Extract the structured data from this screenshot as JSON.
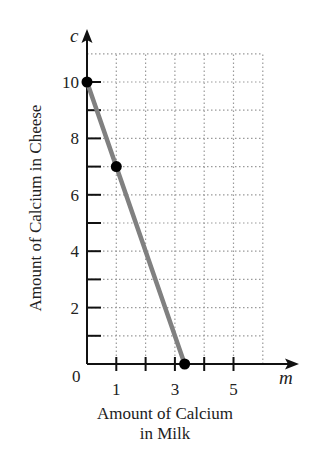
{
  "chart_data": {
    "type": "line",
    "title": "",
    "xlabel": "Amount of Calcium in Milk",
    "xlabel_lines": [
      "Amount of Calcium",
      "in Milk"
    ],
    "ylabel": "Amount of Calcium in Cheese",
    "x_var": "m",
    "y_var": "c",
    "xlim": [
      0,
      6
    ],
    "ylim": [
      0,
      11
    ],
    "x_ticks": [
      1,
      2,
      3,
      4,
      5
    ],
    "x_tick_labels": [
      {
        "value": 1,
        "label": "1"
      },
      {
        "value": 3,
        "label": "3"
      },
      {
        "value": 5,
        "label": "5"
      }
    ],
    "y_ticks": [
      1,
      2,
      3,
      4,
      5,
      6,
      7,
      8,
      9,
      10
    ],
    "y_tick_labels": [
      {
        "value": 2,
        "label": "2"
      },
      {
        "value": 4,
        "label": "4"
      },
      {
        "value": 6,
        "label": "6"
      },
      {
        "value": 8,
        "label": "8"
      },
      {
        "value": 10,
        "label": "10"
      }
    ],
    "origin_label": "0",
    "grid": true,
    "grid_style": "dotted",
    "series": [
      {
        "name": "calcium line",
        "color": "#808080",
        "x": [
          0,
          3.333
        ],
        "y": [
          10,
          0
        ]
      }
    ],
    "points": [
      {
        "x": 0,
        "y": 10
      },
      {
        "x": 1,
        "y": 7
      },
      {
        "x": 3.333,
        "y": 0
      }
    ]
  },
  "colors": {
    "axis": "#111111",
    "grid": "#9a9a9a",
    "line": "#808080",
    "point": "#000000"
  }
}
